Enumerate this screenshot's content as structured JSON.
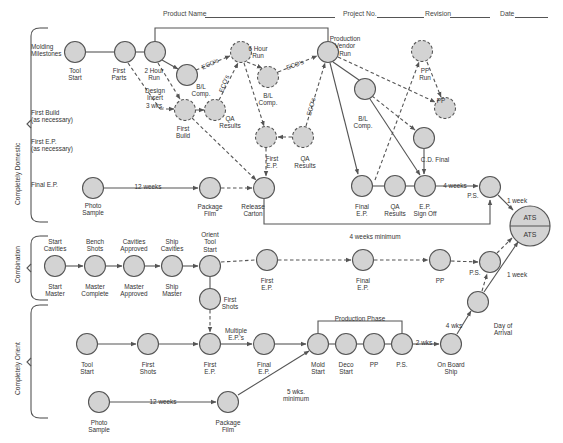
{
  "header": {
    "fields": [
      {
        "label": "Product Name",
        "x": 163,
        "line_x": 205,
        "line_w": 130
      },
      {
        "label": "Project No.",
        "x": 343,
        "line_x": 377,
        "line_w": 47
      },
      {
        "label": "Revision",
        "x": 425,
        "line_x": 450,
        "line_w": 40
      },
      {
        "label": "Date",
        "x": 500,
        "line_x": 515,
        "line_w": 33
      }
    ]
  },
  "sections": [
    {
      "label": "Completely Domestic",
      "x": 14,
      "y": 205
    },
    {
      "label": "Combination",
      "x": 14,
      "y": 283
    },
    {
      "label": "Completely Orient",
      "x": 14,
      "y": 395
    }
  ],
  "row_labels": [
    {
      "text": "Molding\nMilestones",
      "x": 31,
      "y": 43
    },
    {
      "text": "First Build\n(as necessary)",
      "x": 31,
      "y": 109
    },
    {
      "text": "First E.P.\n(as necessary)",
      "x": 31,
      "y": 138
    },
    {
      "text": "Final E.P.",
      "x": 31,
      "y": 181
    }
  ],
  "nodes": [
    {
      "id": "tool-start",
      "x": 75,
      "y": 52,
      "label": "Tool\nStart",
      "lx": 75,
      "ly": 67,
      "dashed": false
    },
    {
      "id": "first-parts",
      "x": 125,
      "y": 52,
      "label": "First\nParts",
      "lx": 119,
      "ly": 67,
      "dashed": false
    },
    {
      "id": "two-hour-run",
      "x": 155,
      "y": 52,
      "label": "2 Hour\nRun",
      "lx": 154,
      "ly": 67,
      "dashed": false
    },
    {
      "id": "bl-comp-1",
      "x": 187,
      "y": 75,
      "label": "B/L\nComp.",
      "lx": 201,
      "ly": 83,
      "dashed": false
    },
    {
      "id": "six-hour-run",
      "x": 241,
      "y": 52,
      "label": "6 Hour\nRun",
      "lx": 258,
      "ly": 45,
      "dashed": true
    },
    {
      "id": "bl-comp-2",
      "x": 268,
      "y": 77,
      "label": "B/L\nComp.",
      "lx": 268,
      "ly": 92,
      "dashed": true
    },
    {
      "id": "prod-vendor-run",
      "x": 328,
      "y": 52,
      "label": "Production\nVendor\nRun",
      "lx": 345,
      "ly": 35,
      "dashed": false
    },
    {
      "id": "first-build",
      "x": 185,
      "y": 110,
      "label": "First\nBuild",
      "lx": 183,
      "ly": 125,
      "dashed": true
    },
    {
      "id": "qa-results-1",
      "x": 215,
      "y": 110,
      "label": "QA\nResults",
      "lx": 230,
      "ly": 115,
      "dashed": true
    },
    {
      "id": "first-ep-dom",
      "x": 266,
      "y": 137,
      "label": "First\nE.P.",
      "lx": 272,
      "ly": 155,
      "dashed": true
    },
    {
      "id": "qa-results-2",
      "x": 303,
      "y": 137,
      "label": "QA\nResults",
      "lx": 305,
      "ly": 155,
      "dashed": true
    },
    {
      "id": "bl-comp-3",
      "x": 365,
      "y": 89,
      "label": "B/L\nComp.",
      "lx": 363,
      "ly": 115,
      "dashed": false
    },
    {
      "id": "pp-run",
      "x": 422,
      "y": 51,
      "label": "PP\nRun",
      "lx": 425,
      "ly": 67,
      "dashed": true
    },
    {
      "id": "pp-dom",
      "x": 445,
      "y": 108,
      "label": "PP",
      "lx": 441,
      "ly": 97,
      "dashed": true
    },
    {
      "id": "pp-cd",
      "x": 424,
      "y": 138,
      "label": "C.D. Final",
      "lx": 435,
      "ly": 156,
      "dashed": false
    },
    {
      "id": "photo-sample-1",
      "x": 93,
      "y": 188,
      "label": "Photo\nSample",
      "lx": 93,
      "ly": 202,
      "dashed": false
    },
    {
      "id": "package-film-1",
      "x": 210,
      "y": 188,
      "label": "Package\nFilm",
      "lx": 210,
      "ly": 203,
      "dashed": false
    },
    {
      "id": "release-carton",
      "x": 264,
      "y": 188,
      "label": "Release\nCarton",
      "lx": 253,
      "ly": 203,
      "dashed": false
    },
    {
      "id": "final-ep-dom",
      "x": 362,
      "y": 186,
      "label": "Final\nE.P.",
      "lx": 362,
      "ly": 203,
      "dashed": false
    },
    {
      "id": "qa-results-3",
      "x": 395,
      "y": 186,
      "label": "QA\nResults",
      "lx": 395,
      "ly": 203,
      "dashed": false
    },
    {
      "id": "ep-sign-off",
      "x": 425,
      "y": 186,
      "label": "E.P.\nSign Off",
      "lx": 425,
      "ly": 203,
      "dashed": false
    },
    {
      "id": "ps-dom",
      "x": 490,
      "y": 187,
      "label": "P.S.",
      "lx": 473,
      "ly": 192,
      "dashed": false
    },
    {
      "id": "start-cavities",
      "x": 55,
      "y": 266,
      "top": "Start\nCavities",
      "label": "Start\nMaster",
      "lx": 55,
      "ly": 283,
      "ty": 238,
      "dashed": false
    },
    {
      "id": "bench-shots",
      "x": 95,
      "y": 266,
      "top": "Bench\nShots",
      "label": "Master\nComplete",
      "lx": 95,
      "ly": 283,
      "ty": 238,
      "dashed": false
    },
    {
      "id": "cavities-approved",
      "x": 134,
      "y": 266,
      "top": "Cavities\nApproved",
      "label": "Master\nApproved",
      "lx": 134,
      "ly": 283,
      "ty": 238,
      "dashed": false
    },
    {
      "id": "ship-cavities",
      "x": 172,
      "y": 266,
      "top": "Ship\nCavities",
      "label": "Ship\nMaster",
      "lx": 172,
      "ly": 283,
      "ty": 238,
      "dashed": false
    },
    {
      "id": "orient-tool-start",
      "x": 210,
      "y": 266,
      "top": "Orient\nTool\nStart",
      "label": "",
      "lx": 210,
      "ly": 283,
      "ty": 231,
      "dashed": false
    },
    {
      "id": "first-shots-comb",
      "x": 210,
      "y": 299,
      "label": "First\nShots",
      "lx": 230,
      "ly": 296,
      "dashed": false
    },
    {
      "id": "first-ep-comb",
      "x": 267,
      "y": 260,
      "label": "First\nE.P.",
      "lx": 267,
      "ly": 277,
      "dashed": false
    },
    {
      "id": "final-ep-comb",
      "x": 363,
      "y": 260,
      "label": "Final\nE.P.",
      "lx": 363,
      "ly": 277,
      "dashed": false
    },
    {
      "id": "pp-comb",
      "x": 440,
      "y": 260,
      "label": "PP",
      "lx": 440,
      "ly": 277,
      "dashed": false
    },
    {
      "id": "ps-comb",
      "x": 490,
      "y": 262,
      "label": "P.S.",
      "lx": 475,
      "ly": 269,
      "dashed": false
    },
    {
      "id": "day-of-arrival",
      "x": 478,
      "y": 302,
      "label": "Day of\nArrival",
      "lx": 503,
      "ly": 322,
      "dashed": false
    },
    {
      "id": "tool-start-or",
      "x": 87,
      "y": 344,
      "label": "Tool\nStart",
      "lx": 87,
      "ly": 361,
      "dashed": false
    },
    {
      "id": "first-shots-or",
      "x": 148,
      "y": 344,
      "label": "First\nShots",
      "lx": 148,
      "ly": 361,
      "dashed": false
    },
    {
      "id": "first-ep-or",
      "x": 210,
      "y": 344,
      "label": "First\nE.P.",
      "lx": 210,
      "ly": 361,
      "dashed": false
    },
    {
      "id": "final-ep-or",
      "x": 264,
      "y": 344,
      "label": "Final\nE.P.",
      "lx": 264,
      "ly": 361,
      "dashed": false
    },
    {
      "id": "mold-start",
      "x": 318,
      "y": 344,
      "label": "Mold\nStart",
      "lx": 318,
      "ly": 361,
      "dashed": false
    },
    {
      "id": "deco-start",
      "x": 346,
      "y": 344,
      "label": "Deco\nStart",
      "lx": 346,
      "ly": 361,
      "dashed": false
    },
    {
      "id": "pp-or",
      "x": 374,
      "y": 344,
      "label": "PP",
      "lx": 374,
      "ly": 361,
      "dashed": false
    },
    {
      "id": "ps-or",
      "x": 402,
      "y": 344,
      "label": "P.S.",
      "lx": 402,
      "ly": 361,
      "dashed": false
    },
    {
      "id": "on-board-ship",
      "x": 451,
      "y": 344,
      "label": "On Board\nShip",
      "lx": 451,
      "ly": 361,
      "dashed": false
    },
    {
      "id": "photo-sample-2",
      "x": 99,
      "y": 402,
      "label": "Photo\nSample",
      "lx": 99,
      "ly": 419,
      "dashed": false
    },
    {
      "id": "package-film-2",
      "x": 228,
      "y": 402,
      "label": "Package\nFilm",
      "lx": 228,
      "ly": 419,
      "dashed": false
    }
  ],
  "ats": {
    "x": 530,
    "y": 226,
    "r": 20,
    "top_label": "ATS",
    "bottom_label": "ATS"
  },
  "edge_labels": [
    {
      "text": "ECO's",
      "x": 210,
      "y": 60,
      "rot": -25
    },
    {
      "text": "ECO's",
      "x": 224,
      "y": 80,
      "rot": -70
    },
    {
      "text": "ECO's",
      "x": 295,
      "y": 61,
      "rot": -20
    },
    {
      "text": "ECO's",
      "x": 311,
      "y": 103,
      "rot": -75
    },
    {
      "text": "Design\nInsert\n3 wks.",
      "x": 155,
      "y": 87,
      "rot": 0
    },
    {
      "text": "12 weeks",
      "x": 148,
      "y": 183,
      "rot": 0
    },
    {
      "text": "4 weeks",
      "x": 455,
      "y": 182,
      "rot": 0
    },
    {
      "text": "1 week",
      "x": 517,
      "y": 197,
      "rot": 0
    },
    {
      "text": "4 weeks minimum",
      "x": 375,
      "y": 233,
      "rot": 0
    },
    {
      "text": "1 week",
      "x": 517,
      "y": 271,
      "rot": 0
    },
    {
      "text": "Multiple\nE.P.'s",
      "x": 236,
      "y": 327,
      "rot": 0
    },
    {
      "text": "Production Phase",
      "x": 360,
      "y": 315,
      "rot": 0
    },
    {
      "text": "2 wks",
      "x": 424,
      "y": 339,
      "rot": 0
    },
    {
      "text": "4 wks",
      "x": 454,
      "y": 322,
      "rot": 0
    },
    {
      "text": "5 wks.\nminimum",
      "x": 296,
      "y": 388,
      "rot": 0
    },
    {
      "text": "12 weeks",
      "x": 163,
      "y": 398,
      "rot": 0
    }
  ],
  "colors": {
    "node_fill": "#d3d3d3",
    "stroke": "#555555",
    "text": "#333333"
  }
}
